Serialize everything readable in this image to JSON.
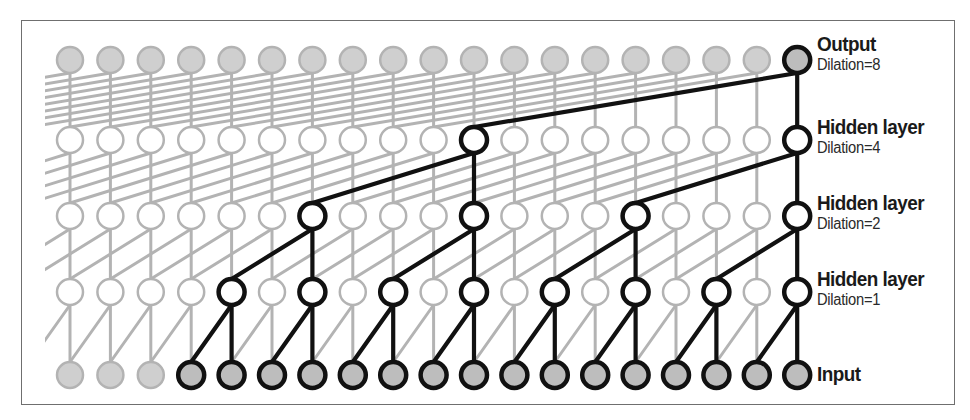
{
  "diagram": {
    "grid": {
      "columns": 19,
      "x_start": 70,
      "x_step": 40.4,
      "node_radius": 13,
      "clip_left": 45
    },
    "colors": {
      "gray_stroke": "#b3b3b3",
      "gray_fill_io": "#cfcfcf",
      "hidden_fill": "#ffffff",
      "active_stroke": "#111111",
      "active_fill_io": "#bdbdbd",
      "frame": "#6f6f6f"
    },
    "layers": [
      {
        "id": "output",
        "y": 60,
        "kind": "io",
        "dilation": 8,
        "label": "Output",
        "sublabel": "Dilation=8",
        "label_top": 33,
        "active_columns": [
          18
        ]
      },
      {
        "id": "hidden4",
        "y": 140,
        "kind": "hidden",
        "dilation": 4,
        "label": "Hidden layer",
        "sublabel": "Dilation=4",
        "label_top": 116,
        "active_columns": [
          10,
          18
        ]
      },
      {
        "id": "hidden2",
        "y": 216,
        "kind": "hidden",
        "dilation": 2,
        "label": "Hidden layer",
        "sublabel": "Dilation=2",
        "label_top": 192,
        "active_columns": [
          6,
          10,
          14,
          18
        ]
      },
      {
        "id": "hidden1",
        "y": 292,
        "kind": "hidden",
        "dilation": 1,
        "label": "Hidden layer",
        "sublabel": "Dilation=1",
        "label_top": 268,
        "active_columns": [
          4,
          6,
          8,
          10,
          12,
          14,
          16,
          18
        ]
      },
      {
        "id": "input",
        "y": 375,
        "kind": "io",
        "dilation": null,
        "label": "Input",
        "sublabel": "",
        "label_top": 363,
        "active_columns": [
          3,
          4,
          5,
          6,
          7,
          8,
          9,
          10,
          11,
          12,
          13,
          14,
          15,
          16,
          17,
          18
        ]
      }
    ]
  }
}
